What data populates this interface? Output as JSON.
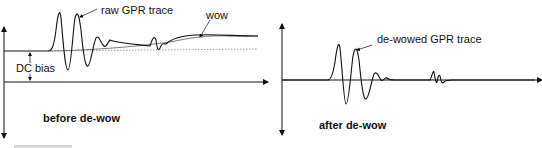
{
  "panels": [
    {
      "id": "before",
      "title": "before de-wow",
      "labels": {
        "trace": "raw GPR trace",
        "wow": "wow",
        "dc_bias": "DC bias"
      }
    },
    {
      "id": "after",
      "title": "after de-wow",
      "labels": {
        "trace": "de-wowed GPR trace"
      }
    }
  ],
  "colors": {
    "trace": "#111111",
    "axis": "#111111",
    "dotted_baseline": "#888888"
  }
}
